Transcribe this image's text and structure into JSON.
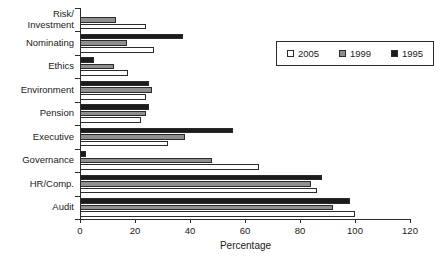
{
  "chart_data": {
    "type": "bar",
    "orientation": "horizontal",
    "title": "",
    "xlabel": "Percentage",
    "ylabel": "",
    "xlim": [
      0,
      120
    ],
    "xticks": [
      0,
      20,
      40,
      60,
      80,
      100,
      120
    ],
    "grid": false,
    "legend_position": "upper-right",
    "categories": [
      "Risk/\nInvestment",
      "Nominating",
      "Ethics",
      "Environment",
      "Pension",
      "Executive",
      "Governance",
      "HR/Comp.",
      "Audit"
    ],
    "series": [
      {
        "name": "2005",
        "color": "#ffffff",
        "values": [
          24,
          27,
          17.5,
          24,
          22,
          32,
          65,
          86,
          100
        ]
      },
      {
        "name": "1999",
        "color": "#8f8f8f",
        "values": [
          13,
          17,
          12.5,
          26,
          24,
          38,
          48,
          84,
          92
        ]
      },
      {
        "name": "1995",
        "color": "#1c1c1c",
        "values": [
          0,
          37.5,
          5,
          25,
          25,
          55.5,
          2,
          88,
          98
        ]
      }
    ]
  },
  "legend": {
    "entries": [
      {
        "label": "2005",
        "swatch": "legend-swatch-2005"
      },
      {
        "label": "1999",
        "swatch": "legend-swatch-1999"
      },
      {
        "label": "1995",
        "swatch": "legend-swatch-1995"
      }
    ]
  }
}
